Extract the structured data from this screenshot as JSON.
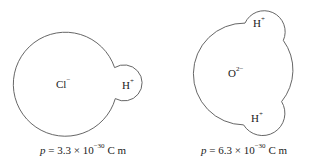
{
  "molecules": [
    {
      "name": "HCl",
      "atoms": [
        {
          "symbol": "Cl",
          "charge": "−"
        },
        {
          "symbol": "H",
          "charge": "+"
        }
      ],
      "caption": {
        "var": "p",
        "eq": " = 3.3 × 10",
        "exp": "−30",
        "unit": " C m"
      }
    },
    {
      "name": "H2O",
      "atoms": [
        {
          "symbol": "H",
          "charge": "+"
        },
        {
          "symbol": "O",
          "charge": "2−"
        },
        {
          "symbol": "H",
          "charge": "+"
        }
      ],
      "caption": {
        "var": "p",
        "eq": " = 6.3 × 10",
        "exp": "−30",
        "unit": " C m"
      }
    }
  ],
  "colors": {
    "outline": "#555555",
    "text": "#222222",
    "background": "#ffffff"
  }
}
